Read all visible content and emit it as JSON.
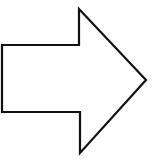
{
  "canvas": {
    "width": 154,
    "height": 161,
    "background_color": "#ffffff",
    "title": "Right-pointing block arrow"
  },
  "shape": {
    "name": "right-arrow",
    "kind": "block-arrow-outline",
    "direction": "right",
    "filled": false,
    "fill_color": "#ffffff",
    "stroke_color": "#111111",
    "stroke_width": 2.2,
    "points": "2,45 79,45 79,9 146,80 80,153 80,112 2,112",
    "vertices": [
      {
        "name": "tail-top-left",
        "x": 2,
        "y": 45
      },
      {
        "name": "shaft-top-right",
        "x": 79,
        "y": 45
      },
      {
        "name": "barb-top",
        "x": 79,
        "y": 9
      },
      {
        "name": "tip",
        "x": 146,
        "y": 80
      },
      {
        "name": "barb-bottom",
        "x": 80,
        "y": 153
      },
      {
        "name": "shaft-bottom-right",
        "x": 80,
        "y": 112
      },
      {
        "name": "tail-bottom-left",
        "x": 2,
        "y": 112
      }
    ]
  }
}
